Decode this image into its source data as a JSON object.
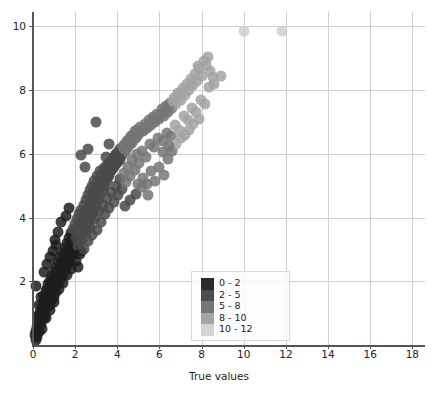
{
  "chart_data": {
    "type": "scatter",
    "title": "",
    "xlabel": "True values",
    "ylabel": "",
    "xlim": [
      0,
      18.6
    ],
    "ylim": [
      0,
      10.45
    ],
    "xticks": [
      0,
      2,
      4,
      6,
      8,
      10,
      12,
      14,
      16,
      18
    ],
    "yticks": [
      2,
      4,
      6,
      8,
      10
    ],
    "grid": true,
    "legend": {
      "position": "lower-center",
      "type": "colorbar-bins",
      "entries": [
        {
          "label": "0 - 2",
          "color": "#2b2b2b"
        },
        {
          "label": "2 - 5",
          "color": "#4d4d4d"
        },
        {
          "label": "5 - 8",
          "color": "#777777"
        },
        {
          "label": "8 - 10",
          "color": "#a6a6a6"
        },
        {
          "label": "10 - 12",
          "color": "#d4d4d4"
        }
      ]
    },
    "colormap": {
      "name": "greys-dark-to-light",
      "description": "Marker darkness encodes true value bin; darker = lower bin",
      "stops": [
        "#1d1d1d",
        "#4a4a4a",
        "#757575",
        "#a3a3a3",
        "#cfcfcf"
      ]
    },
    "marker": {
      "shape": "circle",
      "size_px": 11,
      "opacity": 0.85
    },
    "points": [
      [
        0.15,
        1.85,
        0
      ],
      [
        0.2,
        0.55,
        0
      ],
      [
        0.25,
        0.9,
        0
      ],
      [
        0.3,
        1.25,
        0
      ],
      [
        0.35,
        0.7,
        0
      ],
      [
        0.4,
        1.5,
        0
      ],
      [
        0.45,
        1.05,
        0
      ],
      [
        0.5,
        0.85,
        0
      ],
      [
        0.55,
        1.4,
        0
      ],
      [
        0.6,
        1.15,
        0
      ],
      [
        0.65,
        1.75,
        0
      ],
      [
        0.7,
        1.3,
        0
      ],
      [
        0.75,
        1.6,
        0
      ],
      [
        0.8,
        1.1,
        0
      ],
      [
        0.85,
        1.95,
        0
      ],
      [
        0.9,
        1.45,
        0
      ],
      [
        0.95,
        1.8,
        0
      ],
      [
        1.0,
        1.35,
        0
      ],
      [
        1.05,
        2.1,
        0
      ],
      [
        1.1,
        1.65,
        0
      ],
      [
        1.15,
        2.25,
        0
      ],
      [
        1.2,
        1.9,
        0
      ],
      [
        1.25,
        2.4,
        0
      ],
      [
        1.3,
        2.05,
        0
      ],
      [
        1.35,
        2.55,
        0
      ],
      [
        1.4,
        2.2,
        0
      ],
      [
        1.45,
        2.7,
        0
      ],
      [
        1.5,
        2.35,
        0
      ],
      [
        1.55,
        2.85,
        0
      ],
      [
        1.6,
        2.5,
        0
      ],
      [
        1.65,
        3.0,
        0
      ],
      [
        1.7,
        2.6,
        0
      ],
      [
        1.75,
        3.15,
        0
      ],
      [
        1.8,
        2.75,
        0
      ],
      [
        1.85,
        3.3,
        0
      ],
      [
        1.9,
        2.9,
        0
      ],
      [
        1.95,
        3.45,
        0
      ],
      [
        2.0,
        3.05,
        1
      ],
      [
        2.05,
        3.6,
        1
      ],
      [
        2.1,
        3.2,
        1
      ],
      [
        2.15,
        2.45,
        0
      ],
      [
        2.2,
        3.75,
        1
      ],
      [
        2.25,
        3.35,
        1
      ],
      [
        2.3,
        2.95,
        0
      ],
      [
        2.35,
        3.9,
        1
      ],
      [
        2.4,
        3.5,
        1
      ],
      [
        2.45,
        4.05,
        1
      ],
      [
        2.5,
        3.65,
        1
      ],
      [
        2.55,
        4.2,
        1
      ],
      [
        2.6,
        3.8,
        1
      ],
      [
        2.65,
        4.35,
        1
      ],
      [
        2.7,
        3.95,
        1
      ],
      [
        2.75,
        4.5,
        1
      ],
      [
        2.8,
        4.1,
        1
      ],
      [
        2.85,
        4.65,
        1
      ],
      [
        2.9,
        4.25,
        1
      ],
      [
        2.95,
        4.8,
        1
      ],
      [
        3.0,
        4.4,
        1
      ],
      [
        3.05,
        4.95,
        1
      ],
      [
        3.1,
        4.55,
        1
      ],
      [
        3.15,
        5.1,
        1
      ],
      [
        3.2,
        4.7,
        1
      ],
      [
        3.25,
        5.25,
        1
      ],
      [
        3.3,
        4.85,
        1
      ],
      [
        3.35,
        5.4,
        1
      ],
      [
        3.4,
        5.0,
        1
      ],
      [
        3.45,
        5.5,
        1
      ],
      [
        3.5,
        5.15,
        1
      ],
      [
        3.55,
        5.6,
        1
      ],
      [
        3.6,
        5.3,
        1
      ],
      [
        3.65,
        5.7,
        1
      ],
      [
        3.7,
        5.45,
        1
      ],
      [
        3.75,
        5.8,
        1
      ],
      [
        3.8,
        5.55,
        1
      ],
      [
        3.85,
        5.9,
        1
      ],
      [
        3.9,
        5.65,
        1
      ],
      [
        3.95,
        6.0,
        1
      ],
      [
        4.0,
        5.75,
        1
      ],
      [
        4.05,
        6.05,
        1
      ],
      [
        4.1,
        5.85,
        1
      ],
      [
        4.15,
        6.15,
        1
      ],
      [
        4.2,
        5.95,
        1
      ],
      [
        4.25,
        6.25,
        2
      ],
      [
        4.3,
        6.05,
        2
      ],
      [
        4.35,
        6.3,
        2
      ],
      [
        4.4,
        6.1,
        2
      ],
      [
        4.45,
        6.4,
        2
      ],
      [
        4.5,
        6.2,
        2
      ],
      [
        4.55,
        6.45,
        2
      ],
      [
        4.6,
        6.3,
        2
      ],
      [
        4.65,
        6.55,
        2
      ],
      [
        4.7,
        6.35,
        2
      ],
      [
        4.75,
        6.6,
        2
      ],
      [
        4.8,
        6.45,
        2
      ],
      [
        4.85,
        6.7,
        2
      ],
      [
        4.9,
        6.5,
        2
      ],
      [
        4.95,
        6.75,
        2
      ],
      [
        5.0,
        6.6,
        2
      ],
      [
        5.1,
        6.85,
        2
      ],
      [
        5.2,
        6.7,
        2
      ],
      [
        5.3,
        6.95,
        2
      ],
      [
        5.4,
        6.8,
        2
      ],
      [
        5.5,
        7.05,
        2
      ],
      [
        5.6,
        6.9,
        2
      ],
      [
        5.7,
        7.15,
        2
      ],
      [
        5.8,
        7.0,
        2
      ],
      [
        5.9,
        7.25,
        2
      ],
      [
        6.0,
        7.1,
        2
      ],
      [
        6.1,
        7.4,
        2
      ],
      [
        6.2,
        7.2,
        2
      ],
      [
        6.3,
        7.5,
        2
      ],
      [
        6.4,
        7.3,
        2
      ],
      [
        6.5,
        7.6,
        2
      ],
      [
        6.6,
        7.45,
        2
      ],
      [
        6.7,
        7.75,
        3
      ],
      [
        6.8,
        7.55,
        3
      ],
      [
        6.9,
        7.9,
        3
      ],
      [
        7.0,
        7.7,
        3
      ],
      [
        7.1,
        8.05,
        3
      ],
      [
        7.2,
        7.85,
        3
      ],
      [
        7.3,
        8.2,
        3
      ],
      [
        7.4,
        8.0,
        3
      ],
      [
        7.5,
        8.35,
        3
      ],
      [
        7.6,
        8.15,
        3
      ],
      [
        7.7,
        8.5,
        3
      ],
      [
        7.8,
        8.3,
        3
      ],
      [
        7.9,
        8.65,
        3
      ],
      [
        8.0,
        8.45,
        3
      ],
      [
        8.2,
        8.8,
        3
      ],
      [
        8.4,
        8.6,
        3
      ],
      [
        3.0,
        7.0,
        1
      ],
      [
        10.0,
        9.85,
        4
      ],
      [
        11.8,
        9.85,
        4
      ],
      [
        0.1,
        0.3,
        0
      ],
      [
        0.15,
        0.45,
        0
      ],
      [
        0.2,
        0.25,
        0
      ],
      [
        0.25,
        0.6,
        0
      ],
      [
        0.3,
        0.4,
        0
      ],
      [
        0.35,
        0.95,
        0
      ],
      [
        0.4,
        0.65,
        0
      ],
      [
        0.45,
        1.2,
        0
      ],
      [
        0.5,
        1.55,
        0
      ],
      [
        0.55,
        0.95,
        0
      ],
      [
        0.6,
        1.7,
        0
      ],
      [
        0.65,
        1.25,
        0
      ],
      [
        0.7,
        1.9,
        0
      ],
      [
        0.75,
        1.45,
        0
      ],
      [
        0.8,
        2.0,
        0
      ],
      [
        0.85,
        1.6,
        0
      ],
      [
        0.9,
        2.15,
        0
      ],
      [
        0.95,
        1.7,
        0
      ],
      [
        1.0,
        2.3,
        0
      ],
      [
        1.05,
        1.85,
        0
      ],
      [
        1.1,
        2.45,
        0
      ],
      [
        1.15,
        2.0,
        0
      ],
      [
        1.2,
        2.6,
        0
      ],
      [
        1.25,
        2.15,
        0
      ],
      [
        1.3,
        2.75,
        0
      ],
      [
        1.35,
        2.3,
        0
      ],
      [
        1.4,
        2.9,
        0
      ],
      [
        1.45,
        2.45,
        0
      ],
      [
        1.5,
        3.05,
        0
      ],
      [
        1.55,
        2.6,
        0
      ],
      [
        1.6,
        3.2,
        0
      ],
      [
        1.65,
        2.75,
        0
      ],
      [
        1.7,
        3.35,
        0
      ],
      [
        1.75,
        2.9,
        0
      ],
      [
        1.8,
        3.5,
        0
      ],
      [
        1.85,
        3.05,
        0
      ],
      [
        1.9,
        3.65,
        1
      ],
      [
        1.95,
        3.2,
        0
      ],
      [
        2.0,
        3.8,
        1
      ],
      [
        2.05,
        3.35,
        1
      ],
      [
        2.1,
        3.95,
        1
      ],
      [
        2.15,
        3.5,
        1
      ],
      [
        2.2,
        4.1,
        1
      ],
      [
        2.25,
        3.65,
        1
      ],
      [
        2.3,
        4.25,
        1
      ],
      [
        2.35,
        3.8,
        1
      ],
      [
        2.4,
        4.4,
        1
      ],
      [
        2.45,
        3.95,
        1
      ],
      [
        2.5,
        4.55,
        1
      ],
      [
        2.55,
        4.1,
        1
      ],
      [
        2.6,
        4.7,
        1
      ],
      [
        2.65,
        4.25,
        1
      ],
      [
        2.7,
        4.85,
        1
      ],
      [
        2.75,
        4.4,
        1
      ],
      [
        2.8,
        5.0,
        1
      ],
      [
        2.85,
        4.55,
        1
      ],
      [
        2.9,
        5.15,
        1
      ],
      [
        2.95,
        4.7,
        1
      ],
      [
        3.05,
        5.3,
        1
      ],
      [
        3.1,
        4.85,
        1
      ],
      [
        3.2,
        5.45,
        1
      ],
      [
        3.25,
        5.0,
        1
      ],
      [
        3.35,
        5.55,
        1
      ],
      [
        3.4,
        5.2,
        1
      ],
      [
        3.5,
        5.65,
        1
      ],
      [
        3.55,
        5.35,
        1
      ],
      [
        3.65,
        5.75,
        1
      ],
      [
        3.7,
        5.5,
        1
      ],
      [
        3.8,
        5.85,
        1
      ],
      [
        3.85,
        5.6,
        1
      ],
      [
        3.95,
        5.95,
        1
      ],
      [
        4.0,
        5.7,
        1
      ],
      [
        4.1,
        6.0,
        1
      ],
      [
        4.15,
        5.8,
        1
      ],
      [
        4.3,
        6.15,
        2
      ],
      [
        4.45,
        6.25,
        2
      ],
      [
        4.6,
        6.35,
        2
      ],
      [
        4.75,
        6.45,
        2
      ],
      [
        4.9,
        6.55,
        2
      ],
      [
        5.05,
        6.65,
        2
      ],
      [
        5.25,
        6.75,
        2
      ],
      [
        5.45,
        6.85,
        2
      ],
      [
        5.65,
        7.0,
        2
      ],
      [
        5.85,
        7.1,
        2
      ],
      [
        6.05,
        7.25,
        2
      ],
      [
        6.25,
        7.35,
        2
      ],
      [
        6.45,
        7.5,
        2
      ],
      [
        6.65,
        7.65,
        3
      ],
      [
        6.85,
        7.8,
        3
      ],
      [
        7.05,
        7.95,
        3
      ],
      [
        0.12,
        0.15,
        0
      ],
      [
        0.22,
        0.8,
        0
      ],
      [
        0.32,
        1.05,
        0
      ],
      [
        0.42,
        0.5,
        0
      ],
      [
        0.52,
        1.35,
        0
      ],
      [
        0.62,
        0.85,
        0
      ],
      [
        0.72,
        1.55,
        0
      ],
      [
        0.82,
        1.25,
        0
      ],
      [
        0.92,
        1.8,
        0
      ],
      [
        1.02,
        1.5,
        0
      ],
      [
        1.12,
        2.05,
        0
      ],
      [
        1.22,
        1.75,
        0
      ],
      [
        1.32,
        2.2,
        0
      ],
      [
        1.42,
        1.95,
        0
      ],
      [
        1.52,
        2.5,
        0
      ],
      [
        1.62,
        2.2,
        0
      ],
      [
        1.72,
        2.7,
        0
      ],
      [
        1.82,
        2.4,
        0
      ],
      [
        1.92,
        2.95,
        0
      ],
      [
        2.02,
        2.65,
        0
      ],
      [
        2.12,
        3.1,
        1
      ],
      [
        2.22,
        2.85,
        0
      ],
      [
        2.32,
        3.3,
        1
      ],
      [
        2.42,
        3.0,
        1
      ],
      [
        2.52,
        3.55,
        1
      ],
      [
        2.62,
        3.25,
        1
      ],
      [
        2.72,
        3.7,
        1
      ],
      [
        2.82,
        3.45,
        1
      ],
      [
        2.92,
        3.95,
        1
      ],
      [
        3.02,
        3.6,
        1
      ],
      [
        3.12,
        4.2,
        1
      ],
      [
        3.22,
        3.85,
        1
      ],
      [
        3.32,
        4.4,
        1
      ],
      [
        3.42,
        4.1,
        1
      ],
      [
        3.52,
        4.6,
        1
      ],
      [
        3.62,
        4.3,
        1
      ],
      [
        3.72,
        4.8,
        1
      ],
      [
        3.82,
        4.5,
        1
      ],
      [
        3.92,
        5.0,
        1
      ],
      [
        4.02,
        4.7,
        1
      ],
      [
        4.12,
        5.2,
        1
      ],
      [
        4.22,
        4.9,
        1
      ],
      [
        4.32,
        5.4,
        2
      ],
      [
        4.42,
        5.1,
        2
      ],
      [
        4.52,
        5.6,
        2
      ],
      [
        4.62,
        5.3,
        2
      ],
      [
        4.72,
        5.8,
        2
      ],
      [
        4.82,
        5.5,
        2
      ],
      [
        4.92,
        6.0,
        2
      ],
      [
        5.02,
        5.7,
        2
      ],
      [
        5.15,
        6.1,
        2
      ],
      [
        5.35,
        5.9,
        2
      ],
      [
        5.55,
        6.3,
        2
      ],
      [
        5.75,
        6.2,
        2
      ],
      [
        5.95,
        6.5,
        2
      ],
      [
        6.15,
        6.4,
        2
      ],
      [
        6.35,
        6.65,
        2
      ],
      [
        6.55,
        6.55,
        2
      ],
      [
        6.75,
        6.9,
        3
      ],
      [
        6.95,
        6.75,
        3
      ],
      [
        7.15,
        7.2,
        3
      ],
      [
        7.35,
        7.05,
        3
      ],
      [
        7.55,
        7.45,
        3
      ],
      [
        7.75,
        7.3,
        3
      ],
      [
        7.95,
        7.7,
        3
      ],
      [
        8.15,
        7.55,
        3
      ],
      [
        8.35,
        8.1,
        3
      ],
      [
        8.55,
        8.4,
        3
      ],
      [
        8.6,
        8.2,
        3
      ],
      [
        8.9,
        8.45,
        3
      ],
      [
        5.0,
        5.05,
        2
      ],
      [
        5.2,
        5.25,
        2
      ],
      [
        5.4,
        5.05,
        2
      ],
      [
        5.6,
        5.45,
        2
      ],
      [
        5.8,
        5.15,
        2
      ],
      [
        6.0,
        5.6,
        2
      ],
      [
        6.2,
        5.35,
        2
      ],
      [
        6.4,
        5.85,
        2
      ],
      [
        6.6,
        6.1,
        2
      ],
      [
        6.8,
        6.3,
        3
      ],
      [
        7.0,
        6.5,
        3
      ],
      [
        7.2,
        6.6,
        3
      ],
      [
        7.4,
        6.75,
        3
      ],
      [
        7.6,
        6.95,
        3
      ],
      [
        7.9,
        7.1,
        3
      ],
      [
        2.3,
        5.95,
        1
      ],
      [
        2.45,
        5.6,
        1
      ],
      [
        2.6,
        6.15,
        1
      ],
      [
        3.6,
        6.3,
        1
      ],
      [
        3.45,
        5.9,
        1
      ],
      [
        1.55,
        4.05,
        0
      ],
      [
        1.7,
        4.3,
        0
      ],
      [
        1.35,
        3.85,
        0
      ],
      [
        1.2,
        3.55,
        0
      ],
      [
        1.05,
        3.3,
        0
      ],
      [
        0.5,
        2.3,
        0
      ],
      [
        0.65,
        2.55,
        0
      ],
      [
        0.8,
        2.75,
        0
      ],
      [
        0.95,
        2.95,
        0
      ],
      [
        1.1,
        3.15,
        0
      ],
      [
        4.9,
        4.75,
        1
      ],
      [
        5.15,
        4.95,
        2
      ],
      [
        5.45,
        4.7,
        2
      ],
      [
        4.6,
        4.55,
        1
      ],
      [
        4.35,
        4.35,
        1
      ],
      [
        8.1,
        8.9,
        3
      ],
      [
        8.3,
        9.05,
        3
      ],
      [
        7.85,
        8.75,
        3
      ],
      [
        6.45,
        6.25,
        2
      ],
      [
        6.15,
        6.05,
        2
      ]
    ]
  }
}
